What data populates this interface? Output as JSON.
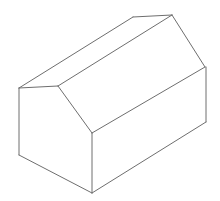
{
  "figure": {
    "title": "Isometric wireframe of a gable-roofed rectangular prism",
    "style": "line drawing",
    "background_color": "#ffffff",
    "line_color": "#6e6e6e",
    "line_width": 1,
    "fill_color": "#ffffff",
    "canvas": {
      "width": 220,
      "height": 201
    },
    "vertices": {
      "near_gable_peak": {
        "name": "near gable peak",
        "x": 58,
        "y": 86
      },
      "far_gable_peak": {
        "name": "far gable peak (ridge)",
        "x": 172,
        "y": 15
      },
      "left_eave": {
        "name": "left eave corner",
        "x": 19,
        "y": 88
      },
      "center_eave": {
        "name": "front eave corner",
        "x": 92,
        "y": 133
      },
      "right_eave": {
        "name": "rear eave corner",
        "x": 205,
        "y": 67
      },
      "bottom_left": {
        "name": "bottom left corner",
        "x": 19,
        "y": 155
      },
      "bottom_center": {
        "name": "bottom front corner",
        "x": 92,
        "y": 193
      },
      "bottom_right": {
        "name": "bottom right corner",
        "x": 206,
        "y": 122
      }
    },
    "faces": [
      {
        "id": "gable-end-face",
        "label": "near gable end wall",
        "points": "19,88 58,86 92,133 92,193 19,155"
      },
      {
        "id": "front-wall-face",
        "label": "front side wall",
        "points": "92,133 206,122 206,67 92,133"
      },
      {
        "id": "near-roof-face",
        "label": "near roof slope",
        "points": "58,86 172,15 205,67 92,133"
      },
      {
        "id": "far-roof-face",
        "label": "far roof slope",
        "points": "19,88 58,86 172,15 133,17"
      }
    ],
    "edges": [
      {
        "id": "ridge-line",
        "label": "roof ridge line",
        "d": "M 58,86 L 172,15"
      },
      {
        "id": "near-roof-eave",
        "label": "near roof slope eave edge",
        "d": "M 92,133 L 205,67"
      },
      {
        "id": "near-gable-slope",
        "label": "near gable right slope",
        "d": "M 58,86 L 92,133"
      },
      {
        "id": "near-gable-left",
        "label": "near gable left slope",
        "d": "M 19,88 L 58,86"
      },
      {
        "id": "far-gable-slope",
        "label": "far gable right slope",
        "d": "M 172,15 L 205,67"
      },
      {
        "id": "far-gable-left",
        "label": "far gable left slope",
        "d": "M 133,17 L 172,15"
      },
      {
        "id": "far-roof-eave",
        "label": "far roof slope eave edge",
        "d": "M 19,88 L 133,17"
      },
      {
        "id": "left-wall-edge",
        "label": "left vertical wall edge",
        "d": "M 19,88 L 19,155"
      },
      {
        "id": "center-wall-edge",
        "label": "front corner vertical edge",
        "d": "M 92,133 L 92,193"
      },
      {
        "id": "right-wall-edge",
        "label": "right corner vertical edge",
        "d": "M 206,67 L 206,122"
      },
      {
        "id": "bottom-left-edge",
        "label": "bottom edge of gable end",
        "d": "M 19,155 L 92,193"
      },
      {
        "id": "bottom-front-edge",
        "label": "bottom edge of front wall",
        "d": "M 92,193 L 206,122"
      }
    ]
  }
}
